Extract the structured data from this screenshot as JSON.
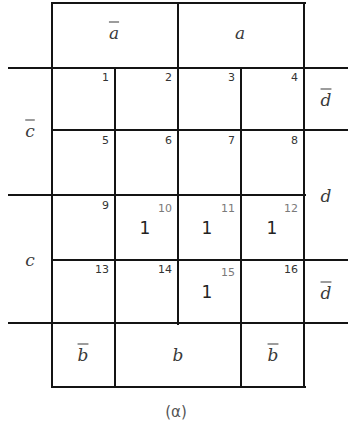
{
  "figure": {
    "caption": "(α)",
    "type": "Karnaugh map, 4 variables (a, b, c, d)"
  },
  "labels": {
    "top": [
      {
        "text": "a",
        "negated": true
      },
      {
        "text": "a",
        "negated": false
      }
    ],
    "bottom": [
      {
        "text": "b",
        "negated": true
      },
      {
        "text": "b",
        "negated": false
      },
      {
        "text": "b",
        "negated": true
      }
    ],
    "left": [
      {
        "text": "c",
        "negated": true
      },
      {
        "text": "c",
        "negated": false
      }
    ],
    "right": [
      {
        "text": "d",
        "negated": true
      },
      {
        "text": "d",
        "negated": false
      },
      {
        "text": "d",
        "negated": true
      }
    ]
  },
  "cells": [
    {
      "n": "1",
      "value": ""
    },
    {
      "n": "2",
      "value": ""
    },
    {
      "n": "3",
      "value": ""
    },
    {
      "n": "4",
      "value": ""
    },
    {
      "n": "5",
      "value": ""
    },
    {
      "n": "6",
      "value": ""
    },
    {
      "n": "7",
      "value": ""
    },
    {
      "n": "8",
      "value": ""
    },
    {
      "n": "9",
      "value": ""
    },
    {
      "n": "10",
      "value": "1"
    },
    {
      "n": "11",
      "value": "1"
    },
    {
      "n": "12",
      "value": "1"
    },
    {
      "n": "13",
      "value": ""
    },
    {
      "n": "14",
      "value": ""
    },
    {
      "n": "15",
      "value": "1"
    },
    {
      "n": "16",
      "value": ""
    }
  ],
  "colors": {
    "line": "#141414",
    "text": "#333333",
    "highlight_number": "#7a7a7a"
  }
}
